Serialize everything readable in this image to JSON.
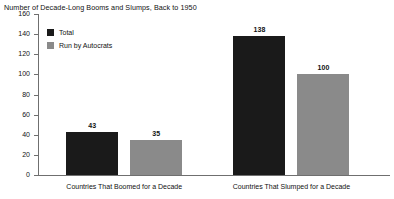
{
  "chart_data": {
    "type": "bar",
    "title": "Number of Decade-Long Booms and Slumps, Back to 1950",
    "xlabel": "",
    "ylabel": "",
    "ylim": [
      0,
      160
    ],
    "yticks": [
      "0",
      "20",
      "40",
      "60",
      "80",
      "100",
      "120",
      "140",
      "160"
    ],
    "grid": false,
    "legend_position": "upper-left-inside",
    "categories": [
      "Countries That Boomed for a Decade",
      "Countries That Slumped for a Decade"
    ],
    "series": [
      {
        "name": "Total",
        "color": "#1a1a1a",
        "values": [
          43,
          138
        ],
        "labels": [
          "43",
          "138"
        ]
      },
      {
        "name": "Run by Autocrats",
        "color": "#8a8a8a",
        "values": [
          35,
          100
        ],
        "labels": [
          "35",
          "100"
        ]
      }
    ]
  },
  "legend": {
    "items": [
      {
        "label": "Total",
        "color": "#1a1a1a"
      },
      {
        "label": "Run by Autocrats",
        "color": "#8a8a8a"
      }
    ]
  },
  "axis": {
    "line_color": "#6f6f6f"
  }
}
